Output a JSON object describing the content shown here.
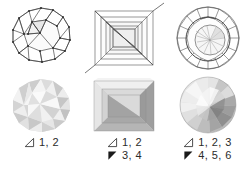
{
  "figure": {
    "background": "#ffffff",
    "ink": "#2b2b2b",
    "columns": [
      {
        "id": "polyhedral-bead",
        "wireframe_name": "polyhedral-bead-wireframe",
        "shaded_name": "polyhedral-bead-shaded",
        "caption": [
          {
            "glyph": "outline-triangle-icon",
            "glyph_fill": "#ffffff",
            "text": "1, 2"
          }
        ]
      },
      {
        "id": "square-step-cut",
        "wireframe_name": "square-step-cut-wireframe",
        "shaded_name": "square-step-cut-shaded",
        "caption": [
          {
            "glyph": "outline-triangle-icon",
            "glyph_fill": "#ffffff",
            "text": "1, 2"
          },
          {
            "glyph": "filled-triangle-icon",
            "glyph_fill": "#1a1a1a",
            "text": "3, 4"
          }
        ]
      },
      {
        "id": "round-brilliant-cut",
        "wireframe_name": "round-brilliant-cut-wireframe",
        "shaded_name": "round-brilliant-cut-shaded",
        "caption": [
          {
            "glyph": "outline-triangle-icon",
            "glyph_fill": "#ffffff",
            "text": "1, 2, 3"
          },
          {
            "glyph": "filled-triangle-icon",
            "glyph_fill": "#1a1a1a",
            "text": "4, 5, 6"
          }
        ]
      }
    ]
  }
}
